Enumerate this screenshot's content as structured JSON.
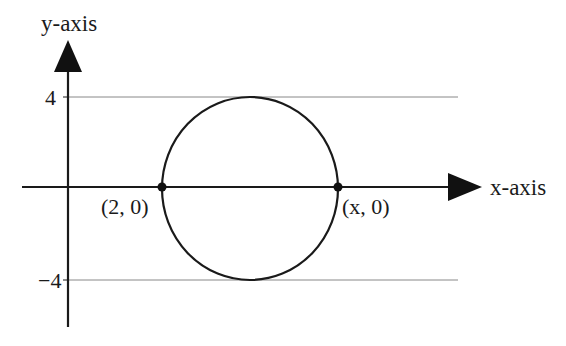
{
  "diagram": {
    "y_axis_label": "y-axis",
    "x_axis_label": "x-axis",
    "tick_top": "4",
    "tick_bottom": "−4",
    "point_left_label": "(2, 0)",
    "point_right_label": "(x, 0)",
    "shapes": {
      "circle": {
        "center": [
          "(2+x)/2",
          0
        ],
        "radius": 4,
        "tangent_lines": [
          4,
          -4
        ]
      },
      "points": [
        {
          "label": "(2, 0)"
        },
        {
          "label": "(x, 0)"
        }
      ]
    },
    "colors": {
      "line": "#1a1a1a",
      "gridline": "#888888",
      "background": "#ffffff"
    }
  }
}
